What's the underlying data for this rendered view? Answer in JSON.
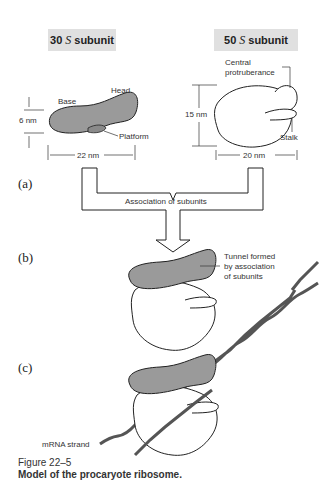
{
  "headers": {
    "small": {
      "prefix": "30",
      "unit": "S",
      "suffix": "subunit"
    },
    "large": {
      "prefix": "50",
      "unit": "S",
      "suffix": "subunit"
    }
  },
  "labels": {
    "base": "Base",
    "head": "Head",
    "platform": "Platform",
    "height_small": "6 nm",
    "width_small": "22 nm",
    "central_1": "Central",
    "central_2": "protruberance",
    "height_large": "15 nm",
    "stalk": "Stalk",
    "width_large": "20 nm",
    "association": "Association of subunits",
    "tunnel_1": "Tunnel formed",
    "tunnel_2": "by association",
    "tunnel_3": "of subunits",
    "mrna": "mRNA strand"
  },
  "panels": {
    "a": "(a)",
    "b": "(b)",
    "c": "(c)"
  },
  "caption": {
    "number": "Figure 22–5",
    "title": "Model of the procaryote ribosome."
  },
  "colors": {
    "header_bg": "#e0e0e0",
    "small_subunit": "#9a9a9a",
    "large_subunit": "#ffffff",
    "mrna": "#555555"
  }
}
